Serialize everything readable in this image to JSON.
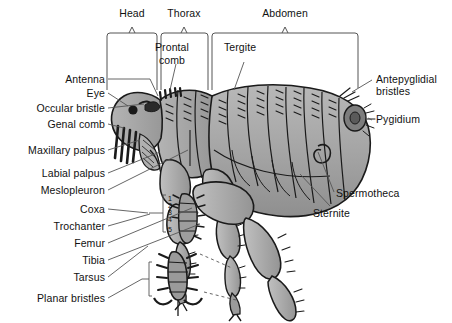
{
  "figure": {
    "view": "lateral",
    "colors": {
      "background": "#ffffff",
      "body_fill": "#a6a6a6",
      "body_fill_light": "#c4c4c4",
      "body_fill_dark": "#8a8a8a",
      "outline": "#1a1a1a",
      "leader_line": "#555555",
      "bracket": "#555555",
      "text": "#111111"
    }
  },
  "region_brackets": [
    {
      "id": "head",
      "label": "Head",
      "x_start": 107,
      "x_end": 157,
      "label_x": 132,
      "label_y": 8
    },
    {
      "id": "thorax",
      "label": "Thorax",
      "x_start": 161,
      "x_end": 208,
      "label_x": 184,
      "label_y": 8
    },
    {
      "id": "abdomen",
      "label": "Abdomen",
      "x_start": 212,
      "x_end": 358,
      "label_x": 285,
      "label_y": 8
    }
  ],
  "labels_left": [
    {
      "id": "antenna",
      "text": "Antenna",
      "x": 105,
      "y": 81
    },
    {
      "id": "eye",
      "text": "Eye",
      "x": 105,
      "y": 95
    },
    {
      "id": "occular-bristle",
      "text": "Occular bristle",
      "x": 105,
      "y": 110
    },
    {
      "id": "genal-comb",
      "text": "Genal comb",
      "x": 105,
      "y": 126
    },
    {
      "id": "maxillary-palpus",
      "text": "Maxillary palpus",
      "x": 105,
      "y": 152
    },
    {
      "id": "labial-palpus",
      "text": "Labial palpus",
      "x": 105,
      "y": 175
    },
    {
      "id": "mesiopleuron",
      "text": "Meslopleuron",
      "x": 105,
      "y": 192
    },
    {
      "id": "coxa",
      "text": "Coxa",
      "x": 105,
      "y": 211
    },
    {
      "id": "trochanter",
      "text": "Trochanter",
      "x": 105,
      "y": 228
    },
    {
      "id": "femur",
      "text": "Femur",
      "x": 105,
      "y": 245
    },
    {
      "id": "tibia",
      "text": "Tibia",
      "x": 105,
      "y": 262
    },
    {
      "id": "tarsus",
      "text": "Tarsus",
      "x": 105,
      "y": 279
    },
    {
      "id": "planar-bristles",
      "text": "Planar bristles",
      "x": 105,
      "y": 300
    }
  ],
  "labels_right": [
    {
      "id": "antepyglidial-bristles",
      "text": "Antepyglidial bristles",
      "x": 374,
      "y": 81,
      "wrap": true,
      "width": 76
    },
    {
      "id": "pygidium",
      "text": "Pygidium",
      "x": 374,
      "y": 121
    },
    {
      "id": "spermotheca",
      "text": "Spermotheca",
      "x": 335,
      "y": 195
    },
    {
      "id": "sternite",
      "text": "Sternite",
      "x": 312,
      "y": 215
    }
  ],
  "labels_inner": [
    {
      "id": "prontal-comb",
      "text": "Prontal comb",
      "x": 170,
      "y": 47,
      "line1": "Prontal",
      "line2": "comb"
    },
    {
      "id": "tergite",
      "text": "Tergite",
      "x": 236,
      "y": 47
    }
  ],
  "tarsal_segments": {
    "note": "tarsomere numbering on hind tarsus",
    "numbers": [
      "1",
      "2",
      "3",
      "4",
      "5"
    ],
    "x": 170,
    "y_positions": [
      198,
      204,
      210,
      217,
      227
    ]
  }
}
